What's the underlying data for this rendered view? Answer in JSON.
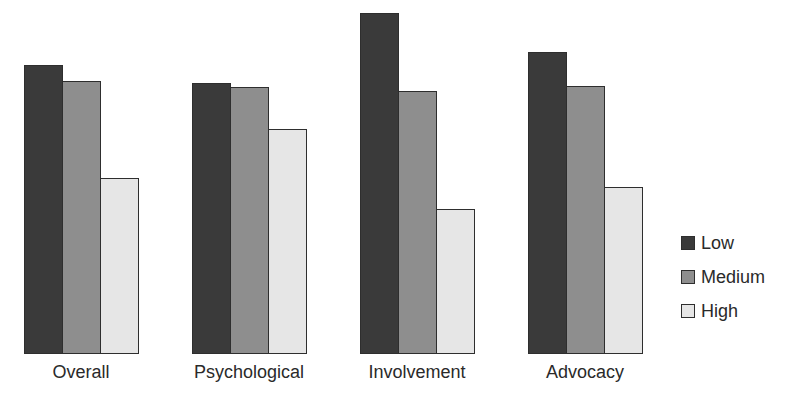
{
  "chart_data": {
    "type": "bar",
    "title": "",
    "xlabel": "",
    "ylabel": "",
    "categories": [
      "Overall",
      "Psychological",
      "Involvement",
      "Advocacy"
    ],
    "series": [
      {
        "name": "Low",
        "color": "#3a3a3a",
        "values": [
          289,
          271,
          341,
          302
        ]
      },
      {
        "name": "Medium",
        "color": "#8e8e8e",
        "values": [
          273,
          267,
          263,
          268
        ]
      },
      {
        "name": "High",
        "color": "#e6e6e6",
        "values": [
          176,
          225,
          145,
          167
        ]
      }
    ],
    "value_note": "relative bar heights in pixels; no y-axis shown",
    "grid": false,
    "legend_position": "right"
  },
  "layout": {
    "baseline_y": 354,
    "group_left_x": [
      24,
      192,
      360,
      528
    ],
    "bar_width": 39
  }
}
